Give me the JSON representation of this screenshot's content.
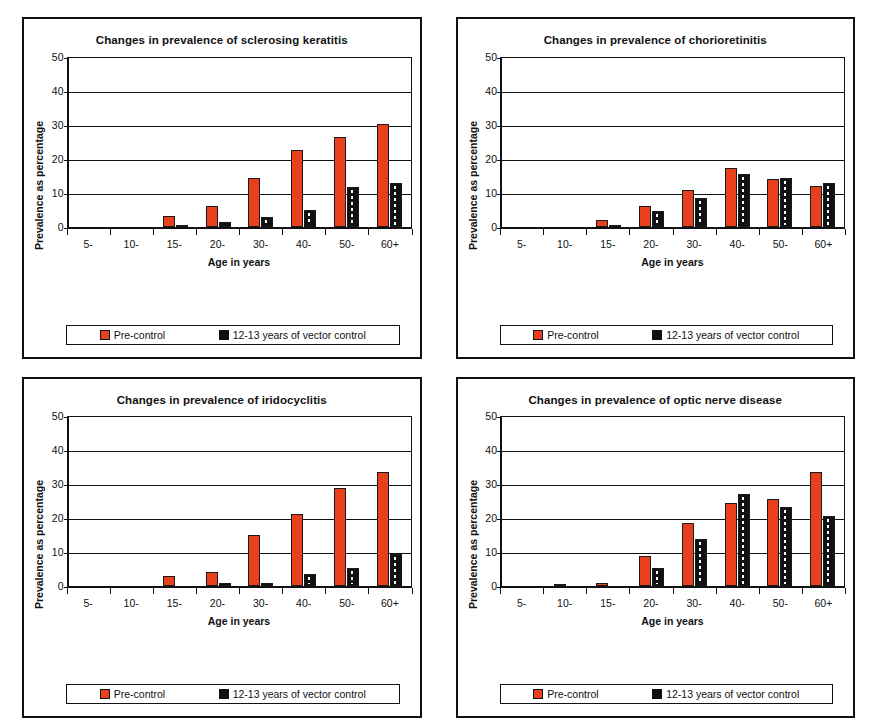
{
  "figure": {
    "panel_count": 4,
    "shared": {
      "ylabel": "Prevalence as percentage",
      "xlabel": "Age in years",
      "categories": [
        "5-",
        "10-",
        "15-",
        "20-",
        "30-",
        "40-",
        "50-",
        "60+"
      ],
      "yticks": [
        0,
        10,
        20,
        30,
        40,
        50
      ],
      "legend": {
        "pre_label": "Pre-control",
        "post_label": "12-13 years of vector control",
        "pre_color": "#e8401c",
        "post_color": "#111111"
      }
    }
  },
  "chart_data": [
    {
      "type": "bar",
      "title": "Changes in prevalence of sclerosing keratitis",
      "xlabel": "Age in years",
      "ylabel": "Prevalence as percentage",
      "categories": [
        "5-",
        "10-",
        "15-",
        "20-",
        "30-",
        "40-",
        "50-",
        "60+"
      ],
      "ylim": [
        0,
        50
      ],
      "yticks": [
        0,
        10,
        20,
        30,
        40,
        50
      ],
      "grid": true,
      "legend_position": "below-plot",
      "series": [
        {
          "name": "Pre-control",
          "color": "#e8401c",
          "values": [
            0,
            0,
            3.2,
            6.2,
            14.3,
            22.6,
            26.5,
            30.3
          ]
        },
        {
          "name": "12-13 years of vector control",
          "color": "#111111",
          "values": [
            0,
            0,
            0.3,
            1.5,
            2.7,
            4.8,
            11.8,
            12.7
          ]
        }
      ]
    },
    {
      "type": "bar",
      "title": "Changes in prevalence of chorioretinitis",
      "xlabel": "Age in years",
      "ylabel": "Prevalence as percentage",
      "categories": [
        "5-",
        "10-",
        "15-",
        "20-",
        "30-",
        "40-",
        "50-",
        "60+"
      ],
      "ylim": [
        0,
        50
      ],
      "yticks": [
        0,
        10,
        20,
        30,
        40,
        50
      ],
      "grid": true,
      "legend_position": "below-plot",
      "series": [
        {
          "name": "Pre-control",
          "color": "#e8401c",
          "values": [
            0,
            0,
            1.9,
            6.2,
            10.9,
            17.2,
            14.0,
            12.1
          ]
        },
        {
          "name": "12-13 years of vector control",
          "color": "#111111",
          "values": [
            0,
            0,
            0.3,
            4.6,
            8.4,
            15.4,
            14.2,
            12.8
          ]
        }
      ]
    },
    {
      "type": "bar",
      "title": "Changes in prevalence of iridocyclitis",
      "xlabel": "Age in years",
      "ylabel": "Prevalence as percentage",
      "categories": [
        "5-",
        "10-",
        "15-",
        "20-",
        "30-",
        "40-",
        "50-",
        "60+"
      ],
      "ylim": [
        0,
        50
      ],
      "yticks": [
        0,
        10,
        20,
        30,
        40,
        50
      ],
      "grid": true,
      "legend_position": "below-plot",
      "series": [
        {
          "name": "Pre-control",
          "color": "#e8401c",
          "values": [
            0,
            0,
            3.0,
            4.3,
            15.0,
            21.1,
            28.8,
            33.7
          ]
        },
        {
          "name": "12-13 years of vector control",
          "color": "#111111",
          "values": [
            0,
            0,
            0,
            0.9,
            0.8,
            3.5,
            5.2,
            9.6
          ]
        }
      ]
    },
    {
      "type": "bar",
      "title": "Changes in prevalence of optic nerve disease",
      "xlabel": "Age in years",
      "ylabel": "Prevalence as percentage",
      "categories": [
        "5-",
        "10-",
        "15-",
        "20-",
        "30-",
        "40-",
        "50-",
        "60+"
      ],
      "ylim": [
        0,
        50
      ],
      "yticks": [
        0,
        10,
        20,
        30,
        40,
        50
      ],
      "grid": true,
      "legend_position": "below-plot",
      "series": [
        {
          "name": "Pre-control",
          "color": "#e8401c",
          "values": [
            0,
            0.3,
            0.9,
            9.0,
            18.5,
            24.6,
            25.6,
            33.6
          ]
        },
        {
          "name": "12-13 years of vector control",
          "color": "#111111",
          "values": [
            0,
            0,
            0,
            5.4,
            13.8,
            27.1,
            23.3,
            20.7
          ]
        }
      ]
    }
  ]
}
